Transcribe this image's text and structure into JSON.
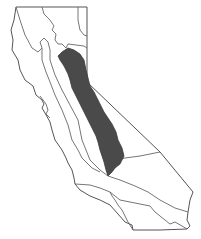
{
  "map": {
    "subject": "California",
    "highlighted_region": "Sierra Nevada",
    "colors": {
      "background": "#ffffff",
      "outline": "#555555",
      "highlight_fill": "#4a4a4a"
    }
  }
}
